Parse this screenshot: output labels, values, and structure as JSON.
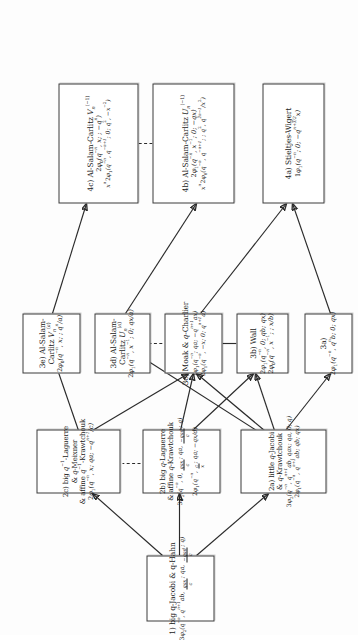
{
  "diagram": {
    "orientation": "rotated-90",
    "nodes": [
      {
        "id": "n1",
        "label": "1) big q-Jacobi & q-Hahn",
        "formulas": [
          "3φ2(q⁻ⁿ, qⁿ⁺¹ab, qax/c; qa, −qad/c; q)"
        ]
      },
      {
        "id": "n2a",
        "label": "2a) little q-Jacobi & q-Krawtchouk",
        "formulas": [
          "3φ2(q⁻ⁿ, qⁿ⁺¹ab, qax; qa, 0; q)",
          "2φ1(q⁻ⁿ, qⁿ⁺¹ab; qb; qx)"
        ]
      },
      {
        "id": "n2b",
        "label": "2b) big q-Laguerre & affine q-Krawtchouk",
        "formulas": [
          "3φ2(q⁻ⁿ, 0, qax/c; qa, −qad/c; q)",
          "2φ1(q⁻ⁿ, c/x; qa; −qx/d)"
        ]
      },
      {
        "id": "n2c",
        "label": "2c) big q⁻¹-Laguerre & q-Meixner & affine q⁻¹-Krawtchouk",
        "formulas": [
          "2φ1(q⁻ⁿ, x; qa; −qⁿ⁺¹/c)"
        ]
      },
      {
        "id": "n3a",
        "label": "3a)",
        "formulas": [
          "2φ1(q⁻ⁿ, qⁿb; 0; qx)"
        ]
      },
      {
        "id": "n3b",
        "label": "3b) Wall",
        "formulas": [
          "2φ1(q⁻ⁿ, 0; qb; qx)",
          "2φ0(q⁻ⁿ, x⁻¹; ; x/b)"
        ]
      },
      {
        "id": "n3c",
        "label": "3c) Moak & q-Charlier",
        "formulas": [
          "1φ1(q⁻ⁿ; qa; −qⁿ⁺¹ax)",
          "2φ1(q⁻ⁿ, −x; 0; qⁿ⁺¹a)"
        ]
      },
      {
        "id": "n3d",
        "label": "3d) Al-Salam-Carlitz Uₙ⁽ᵃ⁾",
        "formulas": [
          "2φ1(q⁻ⁿ, x⁻¹; 0; qx/a)"
        ]
      },
      {
        "id": "n3e",
        "label": "3e) Al-Salam-Carlitz Vₙ⁽ᵃ⁾",
        "formulas": [
          "2φ0(q⁻ⁿ, x; ; qⁿ/a)"
        ]
      },
      {
        "id": "n4a",
        "label": "4a) Stieltjes-Wigert",
        "formulas": [
          "1φ1(q⁻ⁿ; 0; −qⁿ⁺³ᐟ²x)"
        ]
      },
      {
        "id": "n4b",
        "label": "4b) Al-Salam-Carlitz Uₙ⁽⁻¹⁾",
        "formulas": [
          "2φ1(q⁻ⁿ, x⁻¹; 0; −qx)",
          "xⁿ 2φ0(q⁻ⁿ, q⁻ⁿ⁺¹; ; q², q²ⁿ⁻¹/x²)"
        ]
      },
      {
        "id": "n4c",
        "label": "4c) Al-Salam-Carlitz Vₙ⁽⁻¹⁾",
        "formulas": [
          "2φ0(q⁻ⁿ, x; ; −qⁿ)",
          "xⁿ 2φ1(q⁻ⁿ, q⁻ⁿ⁺¹; 0; q², −x⁻²)"
        ]
      }
    ],
    "edges": [
      {
        "from": "n1",
        "to": "n2a",
        "style": "arrow"
      },
      {
        "from": "n1",
        "to": "n2b",
        "style": "arrow"
      },
      {
        "from": "n1",
        "to": "n2c",
        "style": "arrow"
      },
      {
        "from": "n2b",
        "to": "n2c",
        "style": "dashed"
      },
      {
        "from": "n2a",
        "to": "n3a",
        "style": "arrow"
      },
      {
        "from": "n2a",
        "to": "n3b",
        "style": "arrow"
      },
      {
        "from": "n2a",
        "to": "n3c",
        "style": "arrow"
      },
      {
        "from": "n2a",
        "to": "n3d",
        "style": "arrow"
      },
      {
        "from": "n2b",
        "to": "n3b",
        "style": "arrow"
      },
      {
        "from": "n2b",
        "to": "n3c",
        "style": "arrow"
      },
      {
        "from": "n2c",
        "to": "n3c",
        "style": "arrow"
      },
      {
        "from": "n2c",
        "to": "n3e",
        "style": "arrow"
      },
      {
        "from": "n3a",
        "to": "n4a",
        "style": "arrow"
      },
      {
        "from": "n3c",
        "to": "n3b",
        "style": "line"
      },
      {
        "from": "n3c",
        "to": "n4a",
        "style": "arrow"
      },
      {
        "from": "n3d",
        "to": "n3c",
        "style": "dashed"
      },
      {
        "from": "n3d",
        "to": "n4b",
        "style": "arrow"
      },
      {
        "from": "n3e",
        "to": "n4c",
        "style": "arrow"
      },
      {
        "from": "n4b",
        "to": "n4c",
        "style": "dashed"
      }
    ]
  }
}
